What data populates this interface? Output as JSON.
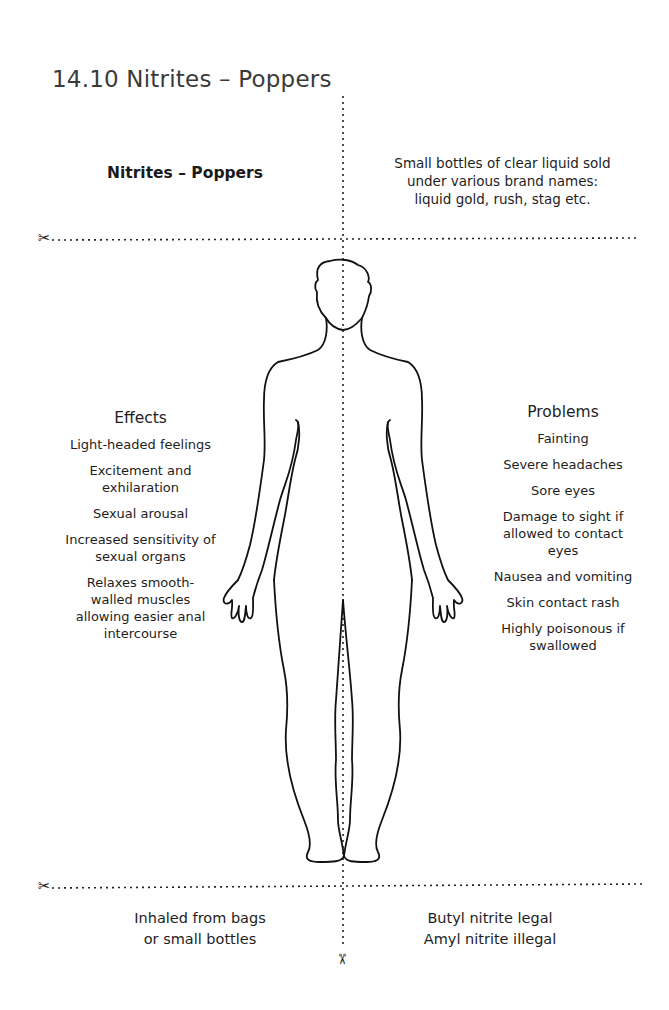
{
  "page": {
    "title": "14.10  Nitrites – Poppers"
  },
  "top": {
    "left_heading": "Nitrites – Poppers",
    "right_description": [
      "Small bottles of clear liquid sold",
      "under various brand names:",
      "liquid gold, rush,  stag etc."
    ]
  },
  "effects": {
    "heading": "Effects",
    "items": [
      "Light-headed feelings",
      "Excitement and exhilaration",
      "Sexual arousal",
      "Increased sensitivity of sexual organs",
      "Relaxes smooth-walled muscles allowing easier anal intercourse"
    ]
  },
  "problems": {
    "heading": "Problems",
    "items": [
      "Fainting",
      "Severe headaches",
      "Sore eyes",
      "Damage to sight if allowed to contact eyes",
      "Nausea and vomiting",
      "Skin contact rash",
      "Highly poisonous if swallowed"
    ]
  },
  "bottom": {
    "left": [
      "Inhaled from bags",
      "or small bottles"
    ],
    "right": [
      "Butyl nitrite legal",
      "Amyl nitrite illegal"
    ]
  },
  "icons": {
    "scissors": "✂"
  }
}
